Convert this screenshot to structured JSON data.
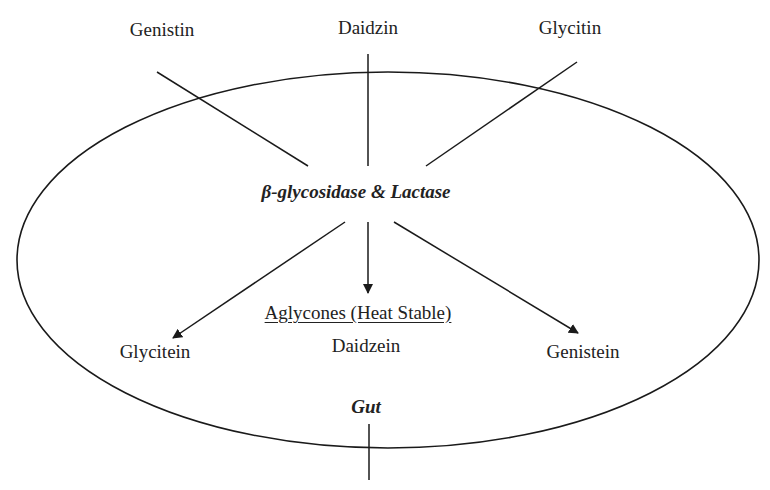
{
  "diagram": {
    "type": "isoflavone-metabolism",
    "region_label": "Gut",
    "glycosides": [
      "Genistin",
      "Daidzin",
      "Glycitin"
    ],
    "enzyme_label": "β-glycosidase & Lactase",
    "aglycones_heading": "Aglycones (Heat Stable)",
    "aglycones": {
      "left": "Glycitein",
      "center": "Daidzein",
      "right": "Genistein"
    },
    "colors": {
      "stroke": "#1a1a1a",
      "text": "#222222",
      "background": "#ffffff"
    }
  }
}
